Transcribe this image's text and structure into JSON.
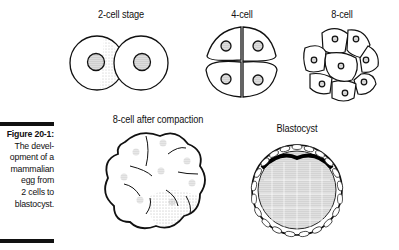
{
  "figure": {
    "number_label": "Figure 20-1:",
    "caption_lines": [
      "The devel-",
      "opment of a",
      "mammalian",
      "egg from",
      "2 cells to",
      "blastocyst."
    ]
  },
  "stages": [
    {
      "label": "2-cell stage"
    },
    {
      "label": "4-cell"
    },
    {
      "label": "8-cell"
    },
    {
      "label": "8-cell after compaction"
    },
    {
      "label": "Blastocyst"
    }
  ]
}
